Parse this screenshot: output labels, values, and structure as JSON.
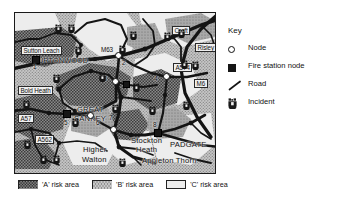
{
  "figure": {
    "kind": "map-diagram",
    "region": "Warrington fire risk area map"
  },
  "map": {
    "places": [
      {
        "name": "Sutton Leach",
        "style": "boxed",
        "x": 6,
        "y": 33
      },
      {
        "name": "BURTONWOOD",
        "style": "caps",
        "x": 18,
        "y": 45
      },
      {
        "name": "Croft",
        "style": "boxed",
        "x": 157,
        "y": 14
      },
      {
        "name": "Risley",
        "style": "boxed",
        "x": 182,
        "y": 30
      },
      {
        "name": "Bold Heath",
        "style": "boxed",
        "x": 4,
        "y": 73
      },
      {
        "name": "GREAT",
        "style": "big",
        "x": 62,
        "y": 97
      },
      {
        "name": "SANKEY",
        "style": "big",
        "x": 60,
        "y": 106
      },
      {
        "name": "Higher",
        "style": "big",
        "x": 68,
        "y": 135
      },
      {
        "name": "Walton",
        "style": "big",
        "x": 67,
        "y": 145
      },
      {
        "name": "Stockton",
        "style": "big",
        "x": 117,
        "y": 126
      },
      {
        "name": "Heath",
        "style": "big",
        "x": 121,
        "y": 135
      },
      {
        "name": "PADGATE",
        "style": "big",
        "x": 157,
        "y": 130
      },
      {
        "name": "Appleton Thorn",
        "style": "big",
        "x": 129,
        "y": 146
      }
    ],
    "roads": [
      {
        "name": "M63",
        "style": "plain",
        "x": 87,
        "y": 36
      },
      {
        "name": "A574",
        "style": "boxed",
        "x": 160,
        "y": 52
      },
      {
        "name": "M6",
        "style": "boxed",
        "x": 181,
        "y": 68
      },
      {
        "name": "A57",
        "style": "boxed",
        "x": 4,
        "y": 103
      },
      {
        "name": "A562",
        "style": "boxed",
        "x": 21,
        "y": 124
      }
    ],
    "nodes": [
      {
        "id": "1",
        "type": "fire-station",
        "x": 21,
        "y": 47,
        "lx": 18,
        "ly": 53
      },
      {
        "id": "2",
        "type": "node",
        "x": 104,
        "y": 43,
        "lx": 109,
        "ly": 49
      },
      {
        "id": "3",
        "type": "node",
        "x": 101,
        "y": 69,
        "lx": 90,
        "ly": 67
      },
      {
        "id": "4",
        "type": "node",
        "x": 152,
        "y": 64,
        "lx": 142,
        "ly": 65
      },
      {
        "id": "5",
        "type": "fire-station",
        "x": 52,
        "y": 101,
        "lx": 51,
        "ly": 108
      },
      {
        "id": "6",
        "type": "node",
        "x": 76,
        "y": 103,
        "lx": 83,
        "ly": 108
      },
      {
        "id": "7",
        "type": "node",
        "x": 99,
        "y": 117,
        "lx": 95,
        "ly": 103
      },
      {
        "id": "8",
        "type": "fire-station",
        "x": 143,
        "y": 120,
        "lx": 140,
        "ly": 113
      }
    ],
    "node_internal": [
      {
        "x": 111,
        "y": 72,
        "type": "fire-station-small"
      }
    ],
    "incidents": [
      {
        "x": 40,
        "y": 6
      },
      {
        "x": 53,
        "y": 6
      },
      {
        "x": 60,
        "y": 28
      },
      {
        "x": 115,
        "y": 13
      },
      {
        "x": 104,
        "y": 27
      },
      {
        "x": 163,
        "y": 11
      },
      {
        "x": 166,
        "y": 42
      },
      {
        "x": 177,
        "y": 43
      },
      {
        "x": 38,
        "y": 56
      },
      {
        "x": 8,
        "y": 82
      },
      {
        "x": 84,
        "y": 55
      },
      {
        "x": 118,
        "y": 65
      },
      {
        "x": 97,
        "y": 86
      },
      {
        "x": 134,
        "y": 88
      },
      {
        "x": 168,
        "y": 83
      },
      {
        "x": 57,
        "y": 100
      },
      {
        "x": 9,
        "y": 122
      },
      {
        "x": 25,
        "y": 137
      },
      {
        "x": 38,
        "y": 137
      },
      {
        "x": 104,
        "y": 140
      },
      {
        "x": 149,
        "y": 14
      }
    ]
  },
  "key": {
    "title": "Key",
    "items": [
      {
        "symbol": "node-circle-icon",
        "label": "Node"
      },
      {
        "symbol": "square-icon",
        "label": "Fire station node"
      },
      {
        "symbol": "road-line-icon",
        "label": "Road"
      },
      {
        "symbol": "incident-icon",
        "label": "Incident"
      }
    ]
  },
  "risk_legend": {
    "items": [
      {
        "label": "'A' risk area",
        "fill": "#6f6f6f"
      },
      {
        "label": "'B' risk area",
        "fill": "#b8b8b8"
      },
      {
        "label": "'C' risk area",
        "fill": "#ececec"
      }
    ]
  },
  "colors": {
    "risk_a": "#6f6f6f",
    "risk_b": "#b8b8b8",
    "risk_c": "#ececec",
    "road": "#141414",
    "frame": "#1a1a1a",
    "text": "#111111"
  }
}
